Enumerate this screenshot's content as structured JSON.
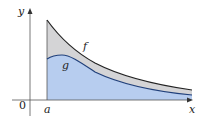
{
  "diagram": {
    "type": "area-between-curves",
    "axes": {
      "x_label": "x",
      "y_label": "y",
      "origin_label": "0"
    },
    "curves": [
      {
        "name": "f",
        "label": "f",
        "color": "#222222"
      },
      {
        "name": "g",
        "label": "g",
        "color": "#1f3f7a"
      }
    ],
    "bounds": {
      "left_label": "a"
    },
    "regions": [
      {
        "name": "between-f-and-g",
        "fill": "#d4d4d6"
      },
      {
        "name": "under-g",
        "fill": "#b7cdef"
      }
    ]
  }
}
